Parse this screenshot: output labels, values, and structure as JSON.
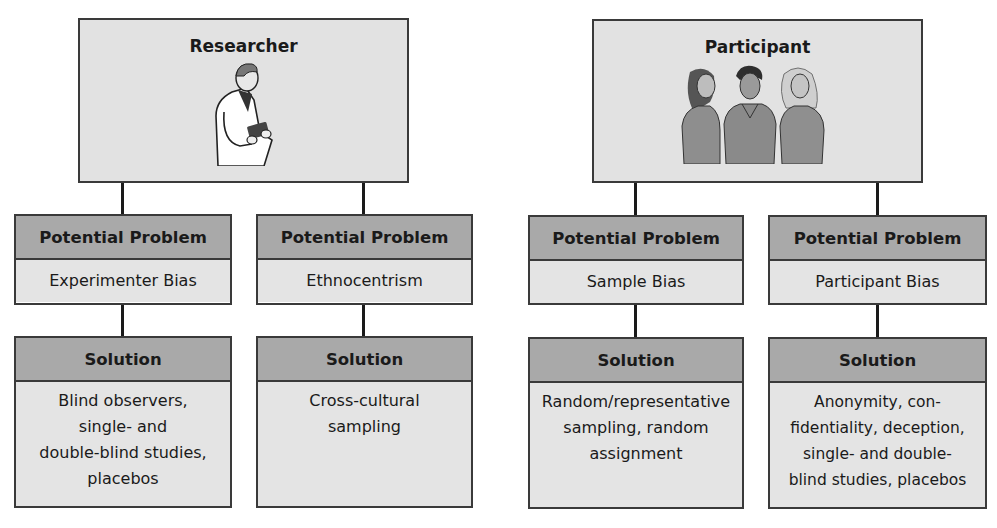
{
  "diagram": {
    "colors": {
      "border": "#3a3a3a",
      "header_fill": "#a9a9a9",
      "body_fill": "#e4e4e4",
      "top_fill": "#e2e2e2",
      "connector": "#1a1a1a"
    },
    "branches": [
      {
        "title": "Researcher",
        "illustration": "researcher-with-notebook-icon",
        "columns": [
          {
            "problem_label": "Potential Problem",
            "problem": "Experimenter Bias",
            "solution_label": "Solution",
            "solution_lines": [
              "Blind observers,",
              "single- and",
              "double-blind studies,",
              "placebos"
            ]
          },
          {
            "problem_label": "Potential Problem",
            "problem": "Ethnocentrism",
            "solution_label": "Solution",
            "solution_lines": [
              "Cross-cultural",
              "sampling"
            ]
          }
        ]
      },
      {
        "title": "Participant",
        "illustration": "three-participants-icon",
        "columns": [
          {
            "problem_label": "Potential Problem",
            "problem": "Sample Bias",
            "solution_label": "Solution",
            "solution_lines": [
              "Random/representative",
              "sampling, random",
              "assignment"
            ]
          },
          {
            "problem_label": "Potential Problem",
            "problem": "Participant Bias",
            "solution_label": "Solution",
            "solution_lines": [
              "Anonymity, con-",
              "fidentiality, deception,",
              "single- and double-",
              "blind studies, placebos"
            ]
          }
        ]
      }
    ]
  }
}
